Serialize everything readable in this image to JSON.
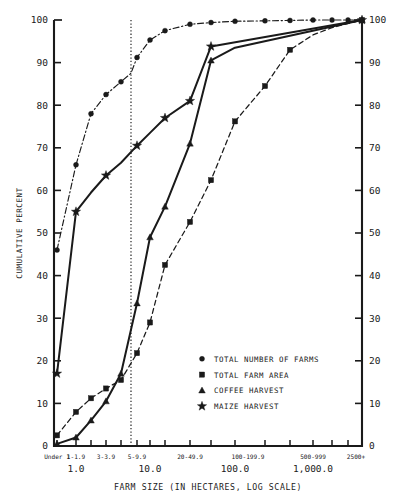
{
  "chart_data": {
    "type": "line",
    "title": "",
    "xlabel": "FARM SIZE (IN HECTARES, LOG SCALE)",
    "ylabel": "CUMULATIVE PERCENT",
    "ylim": [
      0,
      100
    ],
    "yticks": [
      0,
      10,
      20,
      30,
      40,
      50,
      60,
      70,
      80,
      90,
      100
    ],
    "ytick_labels": [
      "0",
      "10",
      "20",
      "30",
      "40",
      "50",
      "60",
      "70",
      "80",
      "90",
      "100"
    ],
    "right_axis": true,
    "right_ytick_labels": [
      "0",
      "10",
      "20",
      "30",
      "40",
      "50",
      "60",
      "70",
      "80",
      "90",
      "100"
    ],
    "grid": false,
    "legend_position": "lower-right",
    "reference_line": {
      "label": "3-3.9 boundary",
      "x_category": "3-3.9",
      "style": "dotted"
    },
    "categories": [
      "Under 1",
      "1-1.9",
      "2-2.9",
      "3-3.9",
      "4-4.9",
      "5-9.9",
      "10-19.9",
      "20-49.9",
      "50-99.9",
      "100-199.9",
      "200-499.9",
      "500-999",
      "1000-2499",
      "2500+"
    ],
    "xtick_labels": [
      "Under 1",
      "1-1.9",
      "3-3.9",
      "5-9.9",
      "20-49.9",
      "100-199.9",
      "500-999",
      "2500+"
    ],
    "xdecade_labels": [
      "1.0",
      "10.0",
      "100.0",
      "1,000.0"
    ],
    "series": [
      {
        "name": "TOTAL NUMBER OF FARMS",
        "marker": "circle",
        "line_style": "dash-dot",
        "x": [
          57,
          76,
          91,
          106,
          121,
          131,
          137,
          150,
          165,
          190,
          211,
          235,
          265,
          290,
          313,
          332,
          348,
          362
        ],
        "values": [
          46.0,
          66.0,
          78.0,
          82.5,
          85.5,
          87.5,
          91.2,
          95.3,
          97.5,
          99.0,
          99.4,
          99.7,
          99.8,
          99.9,
          100.0,
          100.0,
          100.0,
          100.0
        ]
      },
      {
        "name": "TOTAL FARM AREA",
        "marker": "square",
        "line_style": "dashed",
        "x": [
          57,
          76,
          91,
          106,
          121,
          137,
          150,
          165,
          190,
          211,
          235,
          265,
          290,
          313,
          332,
          362
        ],
        "values": [
          2.5,
          8.0,
          11.2,
          13.5,
          15.5,
          21.8,
          29.0,
          42.5,
          52.6,
          62.4,
          76.2,
          84.5,
          93.0,
          96.5,
          98.2,
          100.0
        ]
      },
      {
        "name": "COFFEE HARVEST",
        "marker": "triangle",
        "line_style": "solid",
        "x": [
          57,
          76,
          91,
          106,
          121,
          137,
          150,
          165,
          190,
          211,
          235,
          362
        ],
        "values": [
          0.5,
          2.0,
          6.0,
          10.5,
          17.0,
          33.5,
          49.0,
          56.2,
          71.0,
          90.5,
          93.5,
          100.0
        ]
      },
      {
        "name": "MAIZE HARVEST",
        "marker": "star",
        "line_style": "solid",
        "x": [
          57,
          76,
          91,
          106,
          121,
          137,
          150,
          165,
          190,
          211,
          362
        ],
        "values": [
          17.0,
          55.0,
          59.5,
          63.5,
          66.5,
          70.5,
          73.5,
          77.0,
          81.0,
          93.8,
          100.0
        ]
      }
    ]
  },
  "axes": {
    "y_title": "CUMULATIVE PERCENT",
    "x_title": "FARM SIZE (IN HECTARES, LOG SCALE)"
  },
  "legend": {
    "items": [
      {
        "marker": "circle",
        "label": "TOTAL NUMBER OF FARMS"
      },
      {
        "marker": "square",
        "label": "TOTAL FARM AREA"
      },
      {
        "marker": "triangle",
        "label": "COFFEE HARVEST"
      },
      {
        "marker": "star",
        "label": "MAIZE HARVEST"
      }
    ]
  },
  "colors": {
    "ink": "#1a1a1a",
    "background": "#ffffff"
  }
}
